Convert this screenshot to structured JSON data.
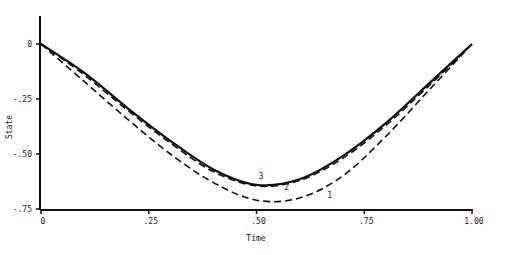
{
  "chart_data": {
    "type": "line",
    "title": "",
    "xlabel": "Time",
    "ylabel": "State",
    "xlim": [
      0,
      1.0
    ],
    "ylim": [
      -0.75,
      0.1
    ],
    "grid": false,
    "legend": "inline curve labels",
    "x_ticks": [
      {
        "value": 0,
        "label": "0"
      },
      {
        "value": 0.25,
        "label": ".25"
      },
      {
        "value": 0.5,
        "label": ".50"
      },
      {
        "value": 0.75,
        "label": ".75"
      },
      {
        "value": 1.0,
        "label": "1.00"
      }
    ],
    "y_ticks": [
      {
        "value": 0,
        "label": "0"
      },
      {
        "value": -0.25,
        "label": "-.25"
      },
      {
        "value": -0.5,
        "label": "-.50"
      },
      {
        "value": -0.75,
        "label": "-.75"
      }
    ],
    "x": [
      0,
      0.1,
      0.2,
      0.3,
      0.4,
      0.5,
      0.6,
      0.7,
      0.8,
      0.9,
      1.0
    ],
    "series": [
      {
        "name": "1",
        "style": "dashed",
        "values": [
          0,
          -0.17,
          -0.34,
          -0.5,
          -0.63,
          -0.71,
          -0.7,
          -0.6,
          -0.42,
          -0.21,
          0
        ]
      },
      {
        "name": "2",
        "style": "dashed",
        "values": [
          0,
          -0.14,
          -0.3,
          -0.45,
          -0.58,
          -0.645,
          -0.62,
          -0.52,
          -0.37,
          -0.19,
          0
        ]
      },
      {
        "name": "3",
        "style": "solid",
        "values": [
          0,
          -0.13,
          -0.29,
          -0.44,
          -0.57,
          -0.64,
          -0.615,
          -0.51,
          -0.36,
          -0.18,
          0
        ]
      }
    ],
    "annotations": [
      {
        "text": "3",
        "x": 0.51,
        "y": -0.615
      },
      {
        "text": "2",
        "x": 0.57,
        "y": -0.665
      },
      {
        "text": "1",
        "x": 0.67,
        "y": -0.7
      }
    ]
  }
}
